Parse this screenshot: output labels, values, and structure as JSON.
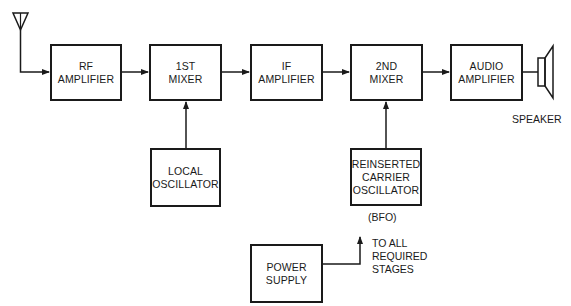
{
  "diagram": {
    "type": "block-diagram",
    "title": "",
    "blocks": {
      "rf_amplifier": "RF\nAMPLIFIER",
      "first_mixer": "1ST\nMIXER",
      "if_amplifier": "IF\nAMPLIFIER",
      "second_mixer": "2ND\nMIXER",
      "audio_amplifier": "AUDIO\nAMPLIFIER",
      "local_oscillator": "LOCAL\nOSCILLATOR",
      "bfo": "REINSERTED\nCARRIER\nOSCILLATOR",
      "power_supply": "POWER\nSUPPLY"
    },
    "labels": {
      "bfo_caption": "(BFO)",
      "speaker": "SPEAKER",
      "to_all_stages": "TO ALL\nREQUIRED\nSTAGES"
    },
    "icons": {
      "antenna": "antenna-icon",
      "speaker": "speaker-icon"
    },
    "connections": [
      [
        "antenna",
        "rf_amplifier"
      ],
      [
        "rf_amplifier",
        "first_mixer"
      ],
      [
        "first_mixer",
        "if_amplifier"
      ],
      [
        "if_amplifier",
        "second_mixer"
      ],
      [
        "second_mixer",
        "audio_amplifier"
      ],
      [
        "audio_amplifier",
        "speaker"
      ],
      [
        "local_oscillator",
        "first_mixer"
      ],
      [
        "bfo",
        "second_mixer"
      ],
      [
        "power_supply",
        "to_all_stages"
      ]
    ],
    "colors": {
      "line": "#1a1a1a",
      "background": "#ffffff"
    }
  }
}
